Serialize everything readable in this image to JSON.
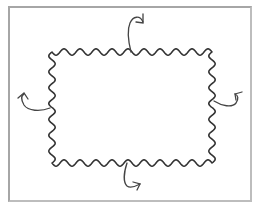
{
  "diagram": {
    "title": "",
    "description": "Rectangle with wavy (sinusoidal) edges and four curved arrows pointing outward from each side",
    "frame": {
      "x": 8,
      "y": 6,
      "width": 244,
      "height": 196,
      "stroke": "#a6a6a6"
    },
    "wavy_rect": {
      "left": 52,
      "top": 52,
      "right": 212,
      "bottom": 163,
      "stroke": "#333333",
      "amplitude": 3.2,
      "top_waves": 10,
      "bottom_waves": 10,
      "left_waves": 7,
      "right_waves": 7
    },
    "arrows": [
      {
        "name": "top-arrow",
        "side": "top",
        "color": "#444444"
      },
      {
        "name": "left-arrow",
        "side": "left",
        "color": "#444444"
      },
      {
        "name": "right-arrow",
        "side": "right",
        "color": "#444444"
      },
      {
        "name": "bottom-arrow",
        "side": "bottom",
        "color": "#444444"
      }
    ]
  }
}
